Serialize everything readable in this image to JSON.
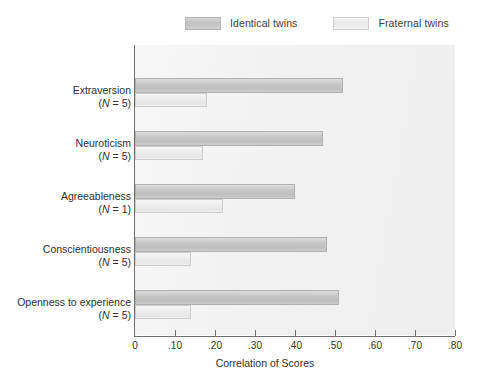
{
  "legend": {
    "entries": [
      {
        "label": "Identical twins",
        "key": "identical",
        "color": "#c6c6c6"
      },
      {
        "label": "Fraternal twins",
        "key": "fraternal",
        "color": "#ededed"
      }
    ]
  },
  "axis": {
    "x_title": "Correlation of Scores",
    "ticks": [
      "0",
      ".10",
      ".20",
      ".30",
      ".40",
      ".50",
      ".60",
      ".70",
      ".80"
    ],
    "tick_values": [
      0,
      0.1,
      0.2,
      0.3,
      0.4,
      0.5,
      0.6,
      0.7,
      0.8
    ]
  },
  "categories": [
    {
      "name": "Extraversion",
      "n": "(N = 5)",
      "n_prefix": "(",
      "n_letter": "N",
      "n_suffix": " = 5)"
    },
    {
      "name": "Neuroticism",
      "n": "(N = 5)",
      "n_prefix": "(",
      "n_letter": "N",
      "n_suffix": " = 5)"
    },
    {
      "name": "Agreeableness",
      "n": "(N = 1)",
      "n_prefix": "(",
      "n_letter": "N",
      "n_suffix": " = 1)"
    },
    {
      "name": "Conscientiousness",
      "n": "(N = 5)",
      "n_prefix": "(",
      "n_letter": "N",
      "n_suffix": " = 5)"
    },
    {
      "name": "Openness to experience",
      "n": "(N = 5)",
      "n_prefix": "(",
      "n_letter": "N",
      "n_suffix": " = 5)"
    }
  ],
  "chart_data": {
    "type": "bar",
    "orientation": "horizontal",
    "title": "",
    "xlabel": "Correlation of Scores",
    "ylabel": "",
    "xlim": [
      0,
      0.8
    ],
    "grid": false,
    "legend_position": "top",
    "categories": [
      "Extraversion (N = 5)",
      "Neuroticism (N = 5)",
      "Agreeableness (N = 1)",
      "Conscientiousness (N = 5)",
      "Openness to experience (N = 5)"
    ],
    "series": [
      {
        "name": "Identical twins",
        "color": "#c6c6c6",
        "values": [
          0.52,
          0.47,
          0.4,
          0.48,
          0.51
        ]
      },
      {
        "name": "Fraternal twins",
        "color": "#ededed",
        "values": [
          0.18,
          0.17,
          0.22,
          0.14,
          0.14
        ]
      }
    ]
  }
}
